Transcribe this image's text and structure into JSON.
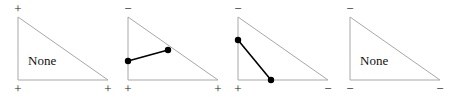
{
  "figure": {
    "width": 452,
    "height": 97,
    "background": "#ffffff",
    "triangle_stroke": "#a8a8a8",
    "segment_stroke": "#000000",
    "dot_fill": "#000000",
    "label_color": "#111111"
  },
  "panels": [
    {
      "id": "panel-1",
      "x": 0,
      "signs": {
        "top_left": "+",
        "bottom_left": "+",
        "bottom_right": "+"
      },
      "none_label": "None",
      "has_none": true,
      "dots": [],
      "segments": []
    },
    {
      "id": "panel-2",
      "x": 110,
      "signs": {
        "top_left": "−",
        "bottom_left": "+",
        "bottom_right": "+"
      },
      "none_label": "",
      "has_none": false,
      "dots": [
        {
          "cx": 18,
          "cy": 61
        },
        {
          "cx": 58,
          "cy": 50
        }
      ],
      "segments": [
        {
          "x1": 18,
          "y1": 61,
          "x2": 58,
          "y2": 50
        }
      ]
    },
    {
      "id": "panel-3",
      "x": 220,
      "signs": {
        "top_left": "−",
        "bottom_left": "+",
        "bottom_right": "−"
      },
      "none_label": "",
      "has_none": false,
      "dots": [
        {
          "cx": 18,
          "cy": 40
        },
        {
          "cx": 51,
          "cy": 80
        }
      ],
      "segments": [
        {
          "x1": 18,
          "y1": 40,
          "x2": 51,
          "y2": 80
        }
      ]
    },
    {
      "id": "panel-4",
      "x": 332,
      "signs": {
        "top_left": "−",
        "bottom_left": "−",
        "bottom_right": "−"
      },
      "none_label": "None",
      "has_none": true,
      "dots": [],
      "segments": []
    }
  ],
  "triangle_geometry": {
    "apex_x": 18,
    "apex_y": 17,
    "base_left_x": 18,
    "base_y": 80,
    "base_right_x": 108
  }
}
